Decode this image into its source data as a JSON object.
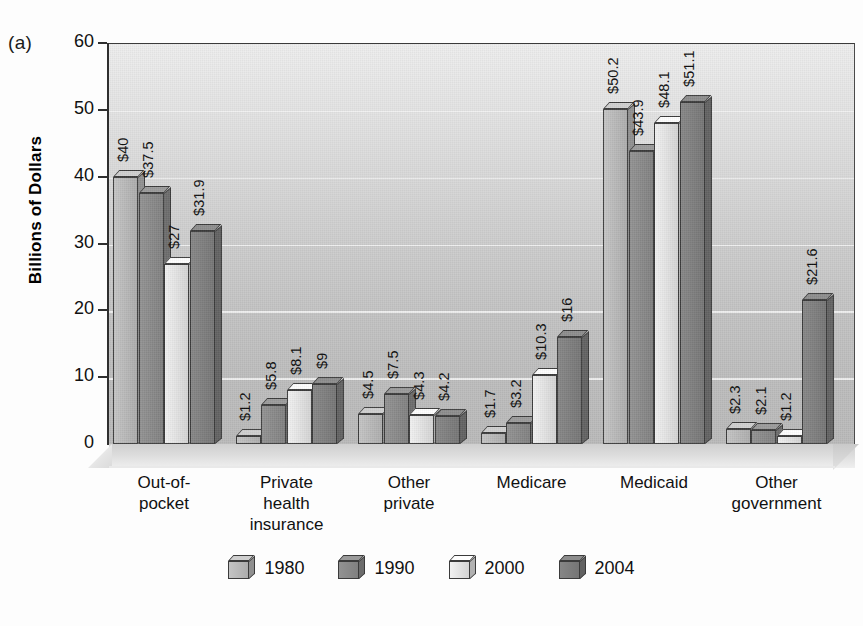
{
  "panel": {
    "label": "(a)"
  },
  "axes": {
    "y_title": "Billions of Dollars",
    "y_ticks": [
      "60",
      "50",
      "40",
      "30",
      "20",
      "10",
      "0"
    ]
  },
  "legend": {
    "items": [
      {
        "label": "1980",
        "color": "#b9b9b9"
      },
      {
        "label": "1990",
        "color": "#8a8a8a"
      },
      {
        "label": "2000",
        "color": "#e3e3e3"
      },
      {
        "label": "2004",
        "color": "#7e7e7e"
      }
    ]
  },
  "chart_data": {
    "type": "bar",
    "title": "",
    "xlabel": "",
    "ylabel": "Billions of Dollars",
    "ylim": [
      0,
      60
    ],
    "yticks": [
      0,
      10,
      20,
      30,
      40,
      50,
      60
    ],
    "grid": true,
    "legend_position": "bottom",
    "categories": [
      "Out-of-pocket",
      "Private health insurance",
      "Other private",
      "Medicare",
      "Medicaid",
      "Other government"
    ],
    "series": [
      {
        "name": "1980",
        "color": "#b9b9b9",
        "values": [
          40,
          1.2,
          4.5,
          1.7,
          50.2,
          2.3
        ],
        "labels": [
          "$40",
          "$1.2",
          "$4.5",
          "$1.7",
          "$50.2",
          "$2.3"
        ]
      },
      {
        "name": "1990",
        "color": "#8a8a8a",
        "values": [
          37.5,
          5.8,
          7.5,
          3.2,
          43.9,
          2.1
        ],
        "labels": [
          "$37.5",
          "$5.8",
          "$7.5",
          "$3.2",
          "$43.9",
          "$2.1"
        ]
      },
      {
        "name": "2000",
        "color": "#e3e3e3",
        "values": [
          27,
          8.1,
          4.3,
          10.3,
          48.1,
          1.2
        ],
        "labels": [
          "$27",
          "$8.1",
          "$4.3",
          "$10.3",
          "$48.1",
          "$1.2"
        ]
      },
      {
        "name": "2004",
        "color": "#7e7e7e",
        "values": [
          31.9,
          9,
          4.2,
          16,
          51.1,
          21.6
        ],
        "labels": [
          "$31.9",
          "$9",
          "$4.2",
          "$16",
          "$51.1",
          "$21.6"
        ]
      }
    ]
  },
  "category_label_lines": [
    [
      "Out-of-",
      "pocket"
    ],
    [
      "Private",
      "health",
      "insurance"
    ],
    [
      "Other",
      "private"
    ],
    [
      "Medicare"
    ],
    [
      "Medicaid"
    ],
    [
      "Other",
      "government"
    ]
  ]
}
